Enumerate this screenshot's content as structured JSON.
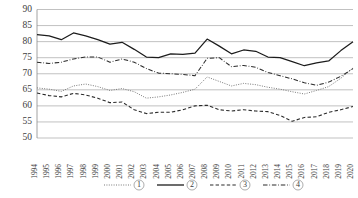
{
  "chart_data": {
    "type": "line",
    "title": "",
    "subtitle": "",
    "xlabel": "",
    "ylabel": "",
    "ylim": [
      50,
      90
    ],
    "yticks": [
      50,
      55,
      60,
      65,
      70,
      75,
      80,
      85,
      90
    ],
    "grid": true,
    "legend_position": "bottom",
    "categories": [
      "1994",
      "1995",
      "1996",
      "1997",
      "1998",
      "1999",
      "2000",
      "2001",
      "2002",
      "2003",
      "2004",
      "2005",
      "2006",
      "2007",
      "2008",
      "2009",
      "2010",
      "2011",
      "2012",
      "2013",
      "2014",
      "2015",
      "2016",
      "2017",
      "2018",
      "2019",
      "2020"
    ],
    "series": [
      {
        "name": "①",
        "style": "dotted",
        "color": "#7a7a7a",
        "values": [
          65.6,
          65.2,
          64.5,
          66.2,
          66.8,
          66.0,
          64.8,
          65.4,
          64.4,
          62.4,
          62.8,
          63.4,
          64.2,
          65.2,
          69.0,
          67.6,
          66.2,
          67.0,
          66.6,
          65.8,
          65.2,
          64.4,
          63.7,
          64.8,
          66.0,
          68.6,
          71.8
        ]
      },
      {
        "name": "②",
        "style": "solid",
        "color": "#1c1c1c",
        "values": [
          82.2,
          81.8,
          80.6,
          82.7,
          81.8,
          80.6,
          79.2,
          79.8,
          77.6,
          75.2,
          75.0,
          76.2,
          76.0,
          76.4,
          80.8,
          78.6,
          76.2,
          77.4,
          77.0,
          75.2,
          75.0,
          73.8,
          72.5,
          73.4,
          74.0,
          77.2,
          80.0
        ]
      },
      {
        "name": "③",
        "style": "dashed",
        "color": "#2b2b2b",
        "values": [
          64.0,
          63.2,
          62.8,
          63.9,
          63.4,
          62.4,
          61.0,
          61.2,
          58.8,
          57.6,
          58.0,
          58.0,
          58.8,
          60.0,
          60.2,
          58.8,
          58.4,
          58.8,
          58.4,
          58.2,
          57.0,
          55.2,
          56.4,
          56.6,
          58.0,
          58.8,
          59.8
        ]
      },
      {
        "name": "④",
        "style": "dash-dot",
        "color": "#2b2b2b",
        "values": [
          73.6,
          73.2,
          73.6,
          74.6,
          75.2,
          75.2,
          73.6,
          74.6,
          73.6,
          71.6,
          70.2,
          70.0,
          69.8,
          69.4,
          74.8,
          75.0,
          72.2,
          72.6,
          72.0,
          70.4,
          69.4,
          68.4,
          67.2,
          66.4,
          67.4,
          69.2,
          71.6
        ]
      }
    ]
  },
  "legend": {
    "items": [
      {
        "label": "①",
        "style": "dotted"
      },
      {
        "label": "②",
        "style": "solid"
      },
      {
        "label": "③",
        "style": "dashed"
      },
      {
        "label": "④",
        "style": "dash-dot"
      }
    ]
  }
}
